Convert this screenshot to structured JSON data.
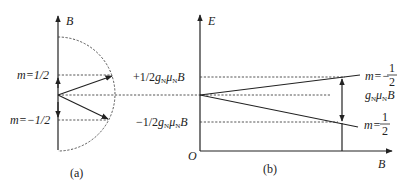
{
  "panel_a": {
    "axis_label": "B",
    "level_upper_label": "m=1/2",
    "level_lower_label": "m=−1/2",
    "caption": "(a)"
  },
  "panel_b": {
    "y_axis_label": "E",
    "x_axis_label": "B",
    "origin_label": "O",
    "upper_energy_prefix": "+1/2",
    "lower_energy_prefix": "−1/2",
    "g": "g",
    "sub_n": "N",
    "mu": "μ",
    "B": "B",
    "upper_line_label_prefix": "m=−",
    "lower_line_label_prefix": "m=",
    "frac_num": "1",
    "frac_den": "2",
    "gap_label_suffix": "B",
    "caption": "(b)"
  },
  "colors": {
    "line": "#222222",
    "dashed": "#444444",
    "background": "#ffffff"
  }
}
